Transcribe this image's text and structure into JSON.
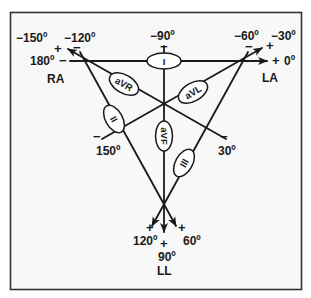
{
  "diagram": {
    "colors": {
      "line": "#1a1a1a",
      "frame": "#333333",
      "background": "#f7f7f7"
    },
    "electrodes": {
      "ra": "RA",
      "la": "LA",
      "ll": "LL"
    },
    "leads": {
      "lead_i": "I",
      "lead_ii": "II",
      "lead_iii": "III",
      "avr": "aVR",
      "avl": "aVL",
      "avf": "aVF"
    },
    "angles": {
      "neg150": "−150º",
      "neg120": "−120º",
      "neg90": "−90º",
      "neg60": "−60º",
      "neg30": "−30º",
      "deg180": "180º",
      "deg0": "0º",
      "deg150": "150º",
      "deg30": "30º",
      "deg120": "120º",
      "deg90": "90º",
      "deg60": "60º"
    },
    "polarity": {
      "plus": "+",
      "minus": "−"
    }
  }
}
